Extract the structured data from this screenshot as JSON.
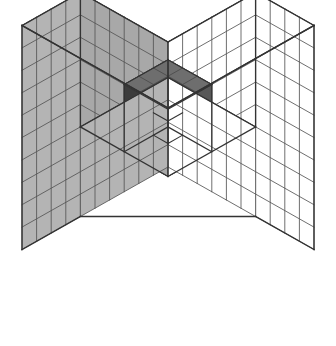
{
  "figure": {
    "title": "Isometric cube cutaway diagram",
    "canvas": {
      "width": 336,
      "height": 346,
      "background": "#ffffff"
    }
  },
  "geometry": {
    "projection": "isometric",
    "outer_cube": {
      "cells_x": 10,
      "cells_y": 10,
      "cells_z": 10,
      "label": "10 x 10 x 10"
    },
    "cut_corner": {
      "cells_x": 6,
      "cells_y": 6,
      "cells_z": 6,
      "label": "6 x 6 x 6 corner removed"
    },
    "inner_cube": {
      "cells_x": 3,
      "cells_y": 3,
      "cells_z": 3,
      "label": "3 x 3 x 3 inner block"
    },
    "inner_notch": {
      "cells_x": 1,
      "cells_y": 1,
      "cells_z": 1,
      "label": "1 x 1 x 1 notch removed"
    },
    "origin_x": 168,
    "origin_y": 332,
    "unit_horizontal": 14.6,
    "unit_vertical": 8.25,
    "unit_height": 22.4
  },
  "colors": {
    "outer_top": "#ffffff",
    "outer_left": "#ffffff",
    "outer_right": "#b4b4b4",
    "cut_floor": "#ffffff",
    "cut_wall_left": "#a8a8a8",
    "cut_wall_right": "#ffffff",
    "inner_top": "#6e6e6e",
    "inner_left": "#585858",
    "inner_right": "#3c3c3c",
    "notch_floor": "#c0c0c0",
    "notch_wall_left": "#bfbfbf",
    "notch_wall_right": "#2a2a2a",
    "grid_stroke": "#555555",
    "grid_stroke_light": "#8a8a8a",
    "outline": "#333333"
  },
  "legend": {
    "outer_label": "outer shell",
    "inner_label": "inner block",
    "notch_label": "notch"
  }
}
